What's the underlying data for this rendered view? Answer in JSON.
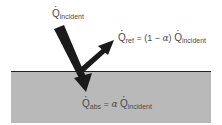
{
  "diagram": {
    "labels": {
      "incident": {
        "symbol": "Q",
        "subscript": "incident"
      },
      "reflected": {
        "symbol": "Q",
        "subscript": "ref",
        "equals": "=",
        "coefficient_prefix": "(1 −",
        "alpha": "α",
        "coefficient_suffix": ")",
        "rhs_symbol": "Q",
        "rhs_subscript": "incident"
      },
      "absorbed": {
        "symbol": "Q",
        "subscript": "abs",
        "equals": "=",
        "alpha": "α",
        "rhs_symbol": "Q",
        "rhs_subscript": "incident"
      }
    },
    "colors": {
      "surface_fill": "#b9b9b9",
      "surface_edge": "#222222",
      "arrow": "#1a1a1a",
      "text": "#4a4a4a",
      "background": "#ffffff"
    }
  }
}
